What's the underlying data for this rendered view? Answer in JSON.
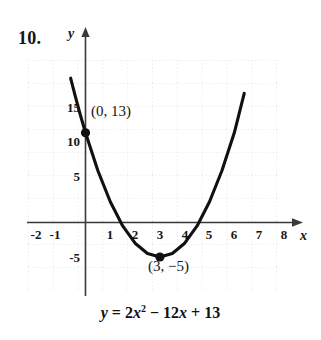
{
  "problem": {
    "number": "10."
  },
  "axes": {
    "y_letter": "y",
    "x_letter": "x",
    "x_ticks": [
      "-2",
      "-1",
      "1",
      "2",
      "3",
      "4",
      "5",
      "6",
      "7",
      "8"
    ],
    "y_ticks": [
      "15",
      "10",
      "5",
      "-5"
    ]
  },
  "annotations": {
    "intercept_label": "(0, 13)",
    "vertex_label": "(3, −5)"
  },
  "equation": {
    "lhs": "y",
    "equals": "=",
    "coef_a": "2",
    "var_a": "x",
    "exp_a": "2",
    "minus": "−",
    "coef_b": "12",
    "var_b": "x",
    "plus": "+",
    "constant": "13",
    "full_text": "y = 2x² − 12x + 13"
  },
  "chart_data": {
    "type": "line",
    "title": "",
    "xlabel": "x",
    "ylabel": "y",
    "equation": "y = 2x^2 - 12x + 13",
    "xlim": [
      -2.3,
      8.6
    ],
    "ylim": [
      -8.5,
      21.0
    ],
    "grid": true,
    "grid_style": "dotted",
    "legend": "none",
    "x_tick_values": [
      -2,
      -1,
      1,
      2,
      3,
      4,
      5,
      6,
      7,
      8
    ],
    "y_tick_values": [
      15,
      10,
      5,
      -5
    ],
    "series": [
      {
        "name": "y = 2x^2 - 12x + 13",
        "x": [
          -0.6,
          -0.4,
          -0.2,
          0.0,
          0.5,
          1.0,
          1.5,
          2.0,
          2.5,
          3.0,
          3.5,
          4.0,
          4.5,
          5.0,
          5.5,
          6.0,
          6.4
        ],
        "values": [
          20.92,
          18.12,
          15.48,
          13.0,
          7.5,
          3.0,
          -0.5,
          -3.0,
          -4.5,
          -5.0,
          -4.5,
          -3.0,
          -0.5,
          3.0,
          7.5,
          13.0,
          18.72
        ]
      }
    ],
    "points": [
      {
        "label": "(0, 13)",
        "x": 0,
        "y": 13
      },
      {
        "label": "(3, −5)",
        "x": 3,
        "y": -5
      }
    ]
  }
}
